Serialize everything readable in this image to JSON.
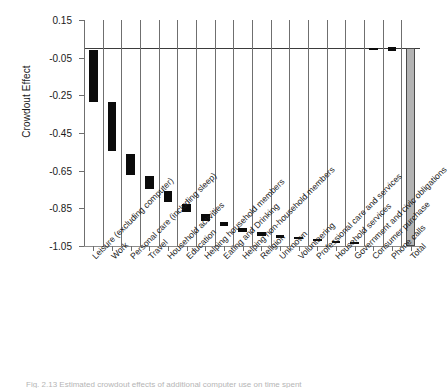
{
  "chart_data": {
    "type": "bar",
    "title": "",
    "xlabel": "",
    "ylabel": "Crowdout Effect",
    "ylim": [
      -1.05,
      0.15
    ],
    "yticks": [
      0.15,
      -0.05,
      -0.25,
      -0.45,
      -0.65,
      -0.85,
      -1.05
    ],
    "ytick_labels": [
      "0.15",
      "-0.05",
      "-0.25",
      "-0.45",
      "-0.65",
      "-0.85",
      "-1.05"
    ],
    "grid": true,
    "legend": "none",
    "zero_reference_line": 0.0,
    "bar_style": "range-bar",
    "categories": [
      "Leisure (excluding computer)",
      "Work",
      "Personal care (including sleep)",
      "Travel",
      "Household activities",
      "Education",
      "Helping household members",
      "Eating and Drinking",
      "Helping non-household members",
      "Religion",
      "Unknown",
      "Volunteering",
      "Professional care and services",
      "Household services",
      "Government and civic obligations",
      "Consumer purchase",
      "Phone calls",
      "Total"
    ],
    "series": [
      {
        "name": "Crowdout Effect range",
        "low": [
          -0.285,
          -0.545,
          -0.675,
          -0.75,
          -0.815,
          -0.872,
          -0.915,
          -0.945,
          -0.975,
          -0.995,
          -1.005,
          -1.015,
          -1.022,
          -1.03,
          -1.034,
          -0.01,
          -0.015,
          -1.05
        ],
        "high": [
          -0.01,
          -0.285,
          -0.56,
          -0.68,
          -0.76,
          -0.825,
          -0.88,
          -0.925,
          -0.955,
          -0.975,
          -0.992,
          -1.002,
          -1.012,
          -1.022,
          -1.028,
          0.0,
          0.005,
          0.0
        ]
      }
    ],
    "total_bar": {
      "category": "Total",
      "value": -1.05,
      "color": "#b3b3b3",
      "border_color": "#4a4a4a"
    },
    "colors": {
      "bar": "#0b0b0b",
      "total_bar": "#b3b3b3",
      "grid": "#6f6f6f",
      "axis": "#8c8c8c",
      "zero_line": "#3b3b3b",
      "text": "#1a1a1a"
    }
  },
  "caption": {
    "text": "Fig. 2.13   Estimated crowdout effects of additional computer use on time spent"
  }
}
